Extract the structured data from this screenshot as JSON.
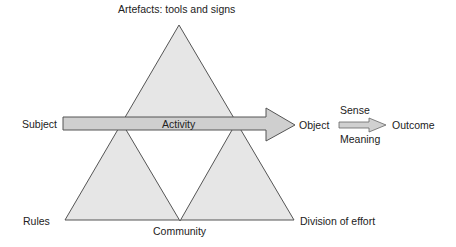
{
  "diagram": {
    "type": "activity-system-triangle",
    "nodes": {
      "artefacts": "Artefacts: tools and signs",
      "subject": "Subject",
      "object": "Object",
      "outcome": "Outcome",
      "rules": "Rules",
      "community": "Community",
      "division": "Division of effort"
    },
    "arrows": {
      "activity": "Activity",
      "sense": "Sense",
      "meaning": "Meaning"
    },
    "colors": {
      "triangle_fill": "#e6e6e6",
      "triangle_stroke": "#555555",
      "arrow_fill": "#cfcfcf",
      "arrow_stroke": "#555555"
    }
  }
}
